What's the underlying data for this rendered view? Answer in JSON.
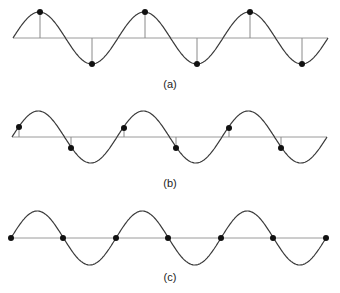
{
  "panels": [
    {
      "id": "a",
      "label": "(a)",
      "axis_y": 38,
      "x_start": 13,
      "x_end": 328,
      "amplitude": 26,
      "period": 105,
      "phase_desc": "sampled at peaks and troughs",
      "samples": [
        {
          "x": 40,
          "y": 12
        },
        {
          "x": 92,
          "y": 64
        },
        {
          "x": 145,
          "y": 12
        },
        {
          "x": 197,
          "y": 64
        },
        {
          "x": 250,
          "y": 12
        },
        {
          "x": 302,
          "y": 64
        }
      ],
      "label_pos": {
        "x": 170,
        "y": 88
      }
    },
    {
      "id": "b",
      "label": "(b)",
      "axis_y": 137,
      "x_start": 12,
      "x_end": 327,
      "amplitude": 26,
      "period": 105,
      "phase_desc": "sampled at intermediate phase",
      "samples": [
        {
          "x": 19,
          "y": 127
        },
        {
          "x": 71,
          "y": 148
        },
        {
          "x": 124,
          "y": 128
        },
        {
          "x": 176,
          "y": 148
        },
        {
          "x": 229,
          "y": 128
        },
        {
          "x": 281,
          "y": 148
        }
      ],
      "label_pos": {
        "x": 170,
        "y": 187
      }
    },
    {
      "id": "c",
      "label": "(c)",
      "axis_y": 238,
      "x_start": 11,
      "x_end": 326,
      "amplitude": 27,
      "period": 105,
      "phase_desc": "sampled at zero crossings",
      "samples": [
        {
          "x": 11,
          "y": 238
        },
        {
          "x": 63,
          "y": 238
        },
        {
          "x": 116,
          "y": 238
        },
        {
          "x": 168,
          "y": 238
        },
        {
          "x": 221,
          "y": 238
        },
        {
          "x": 273,
          "y": 238
        },
        {
          "x": 326,
          "y": 238
        }
      ],
      "label_pos": {
        "x": 170,
        "y": 281
      }
    }
  ]
}
